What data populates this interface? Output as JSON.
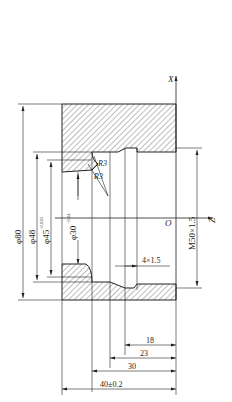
{
  "axes": {
    "x_label": "X",
    "z_label": "Z",
    "origin_label": "O"
  },
  "diameters": [
    {
      "label": "φ80",
      "x": 23
    },
    {
      "label": "φ48",
      "x": 37
    },
    {
      "label": "φ45",
      "tol_upper": "+0.026",
      "tol_lower": "0",
      "x": 51
    },
    {
      "label": "φ30",
      "tol_upper": "+0.04",
      "tol_lower": "0",
      "x": 78
    }
  ],
  "radii": [
    "R3",
    "R3"
  ],
  "thread": "M50×1.5",
  "groove": "4×1.5",
  "lengths": [
    {
      "label": "18"
    },
    {
      "label": "23"
    },
    {
      "label": "30"
    },
    {
      "label": "40±0.2"
    }
  ],
  "colors": {
    "line": "#222222",
    "hatch": "#444444"
  }
}
